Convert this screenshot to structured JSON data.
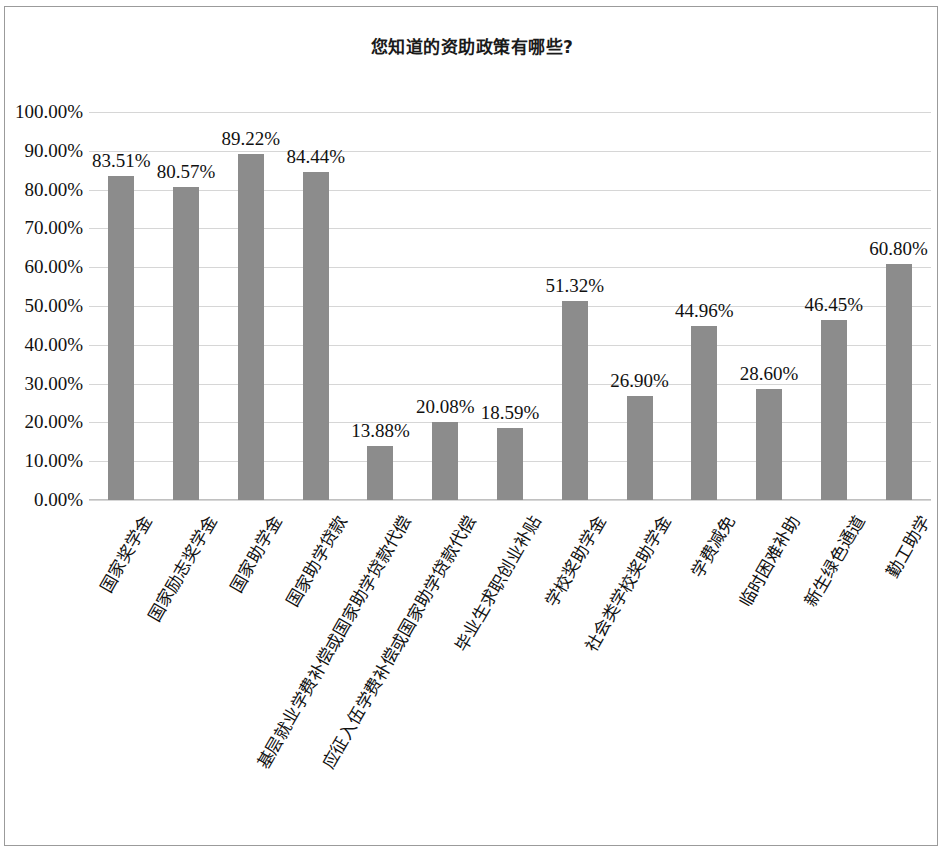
{
  "chart_data": {
    "type": "bar",
    "title": "您知道的资助政策有哪些?",
    "xlabel": "",
    "ylabel": "",
    "ylim": [
      0,
      100
    ],
    "grid": true,
    "legend": "none",
    "orientation": "vertical",
    "bar_color": "#8c8c8c",
    "value_suffix": "%",
    "categories": [
      "国家奖学金",
      "国家励志奖学金",
      "国家助学金",
      "国家助学贷款",
      "基层就业学费补偿或国家助学贷款代偿",
      "应征入伍学费补偿或国家助学贷款代偿",
      "毕业生求职创业补贴",
      "学校奖助学金",
      "社会类学校奖助学金",
      "学费减免",
      "临时困难补助",
      "新生绿色通道",
      "勤工助学"
    ],
    "values": [
      83.51,
      80.57,
      89.22,
      84.44,
      13.88,
      20.08,
      18.59,
      51.32,
      26.9,
      44.96,
      28.6,
      46.45,
      60.8
    ],
    "value_labels": [
      "83.51%",
      "80.57%",
      "89.22%",
      "84.44%",
      "13.88%",
      "20.08%",
      "18.59%",
      "51.32%",
      "26.90%",
      "44.96%",
      "28.60%",
      "46.45%",
      "60.80%"
    ],
    "ytick_values": [
      0,
      10,
      20,
      30,
      40,
      50,
      60,
      70,
      80,
      90,
      100
    ],
    "ytick_labels": [
      "0.00%",
      "10.00%",
      "20.00%",
      "30.00%",
      "40.00%",
      "50.00%",
      "60.00%",
      "70.00%",
      "80.00%",
      "90.00%",
      "100.00%"
    ]
  }
}
